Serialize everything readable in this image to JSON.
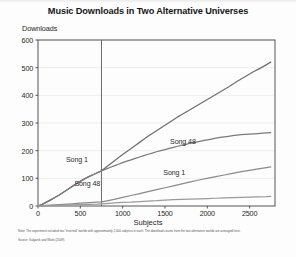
{
  "figure": {
    "title": "Music Downloads in Two Alternative Universes",
    "notes": {
      "note": "Note: The experiment included two \"inverted\" worlds with approximately 2,000 subjects in each. The download counts from the two alternative worlds are averaged here.",
      "source": "Source: Salganik and Watts (2009)."
    }
  },
  "chart_data": {
    "type": "line",
    "title": "Music Downloads in Two Alternative Universes",
    "xlabel": "Subjects",
    "ylabel": "Downloads",
    "xlim": [
      0,
      2800
    ],
    "ylim": [
      0,
      600
    ],
    "xticks": [
      0,
      500,
      1000,
      1500,
      2000,
      2500
    ],
    "yticks": [
      0,
      100,
      200,
      300,
      400,
      500,
      600
    ],
    "grid": true,
    "legend_position": "inline-annotations",
    "annotations": [
      {
        "text": "Song 1",
        "x": 330,
        "y": 165,
        "side": "left"
      },
      {
        "text": "Song 48",
        "x": 430,
        "y": 78,
        "side": "left"
      },
      {
        "text": "Song 48",
        "x": 1560,
        "y": 230,
        "side": "right"
      },
      {
        "text": "Song 1",
        "x": 1480,
        "y": 118,
        "side": "right"
      }
    ],
    "inversion_marker": {
      "x": 750,
      "label": ""
    },
    "series": [
      {
        "name": "Song 48 (inverted world, post-inversion)",
        "color": "#6f6f6f",
        "x": [
          0,
          50,
          100,
          150,
          200,
          250,
          300,
          350,
          400,
          450,
          500,
          550,
          600,
          650,
          700,
          750,
          800,
          850,
          900,
          950,
          1000,
          1050,
          1100,
          1150,
          1200,
          1250,
          1300,
          1350,
          1400,
          1450,
          1500,
          1550,
          1600,
          1650,
          1700,
          1750,
          1800,
          1850,
          1900,
          1950,
          2000,
          2050,
          2100,
          2150,
          2200,
          2250,
          2300,
          2350,
          2400,
          2450,
          2500,
          2550,
          2600,
          2650,
          2700,
          2750
        ],
        "y": [
          0,
          6,
          14,
          22,
          31,
          40,
          50,
          60,
          70,
          80,
          89,
          98,
          106,
          113,
          120,
          127,
          139,
          151,
          163,
          174,
          186,
          197,
          208,
          219,
          230,
          241,
          252,
          262,
          272,
          282,
          292,
          302,
          312,
          322,
          331,
          340,
          349,
          358,
          367,
          376,
          385,
          394,
          403,
          412,
          421,
          430,
          440,
          450,
          459,
          468,
          477,
          486,
          494,
          502,
          511,
          520
        ]
      },
      {
        "name": "Song 1 (inverted world, post-inversion)",
        "color": "#7a7a7a",
        "x": [
          0,
          50,
          100,
          150,
          200,
          250,
          300,
          350,
          400,
          450,
          500,
          550,
          600,
          650,
          700,
          750,
          800,
          850,
          900,
          950,
          1000,
          1050,
          1100,
          1150,
          1200,
          1250,
          1300,
          1350,
          1400,
          1450,
          1500,
          1550,
          1600,
          1650,
          1700,
          1750,
          1800,
          1850,
          1900,
          1950,
          2000,
          2050,
          2100,
          2150,
          2200,
          2250,
          2300,
          2350,
          2400,
          2450,
          2500,
          2550,
          2600,
          2650,
          2700,
          2750
        ],
        "y": [
          0,
          6,
          14,
          22,
          31,
          40,
          50,
          60,
          70,
          80,
          89,
          98,
          106,
          113,
          120,
          127,
          133,
          139,
          145,
          151,
          157,
          162,
          167,
          172,
          177,
          182,
          187,
          191,
          196,
          200,
          204,
          208,
          212,
          216,
          220,
          223,
          227,
          230,
          233,
          236,
          239,
          242,
          245,
          248,
          250,
          252,
          254,
          256,
          258,
          259,
          260,
          261,
          262,
          263,
          264,
          265
        ]
      },
      {
        "name": "Song 1 (lower trajectory)",
        "color": "#8a8a8a",
        "x": [
          0,
          100,
          200,
          300,
          400,
          500,
          600,
          700,
          750,
          800,
          900,
          1000,
          1100,
          1200,
          1300,
          1400,
          1500,
          1600,
          1700,
          1800,
          1900,
          2000,
          2100,
          2200,
          2300,
          2400,
          2500,
          2600,
          2700,
          2750
        ],
        "y": [
          0,
          2,
          4,
          6,
          8,
          10,
          12,
          14,
          15,
          18,
          24,
          31,
          38,
          45,
          52,
          59,
          66,
          73,
          80,
          87,
          94,
          100,
          106,
          112,
          118,
          124,
          129,
          134,
          139,
          141
        ]
      },
      {
        "name": "Song 48 (lower trajectory)",
        "color": "#9a9a9a",
        "x": [
          0,
          100,
          200,
          300,
          400,
          500,
          600,
          700,
          750,
          800,
          900,
          1000,
          1100,
          1200,
          1300,
          1400,
          1500,
          1600,
          1700,
          1800,
          1900,
          2000,
          2100,
          2200,
          2300,
          2400,
          2500,
          2600,
          2700,
          2750
        ],
        "y": [
          0,
          1,
          2,
          3,
          4,
          5,
          6,
          7,
          8,
          9,
          11,
          13,
          14,
          16,
          18,
          19,
          21,
          23,
          24,
          25,
          26,
          27,
          28,
          29,
          30,
          31,
          32,
          33,
          34,
          35
        ]
      }
    ]
  }
}
